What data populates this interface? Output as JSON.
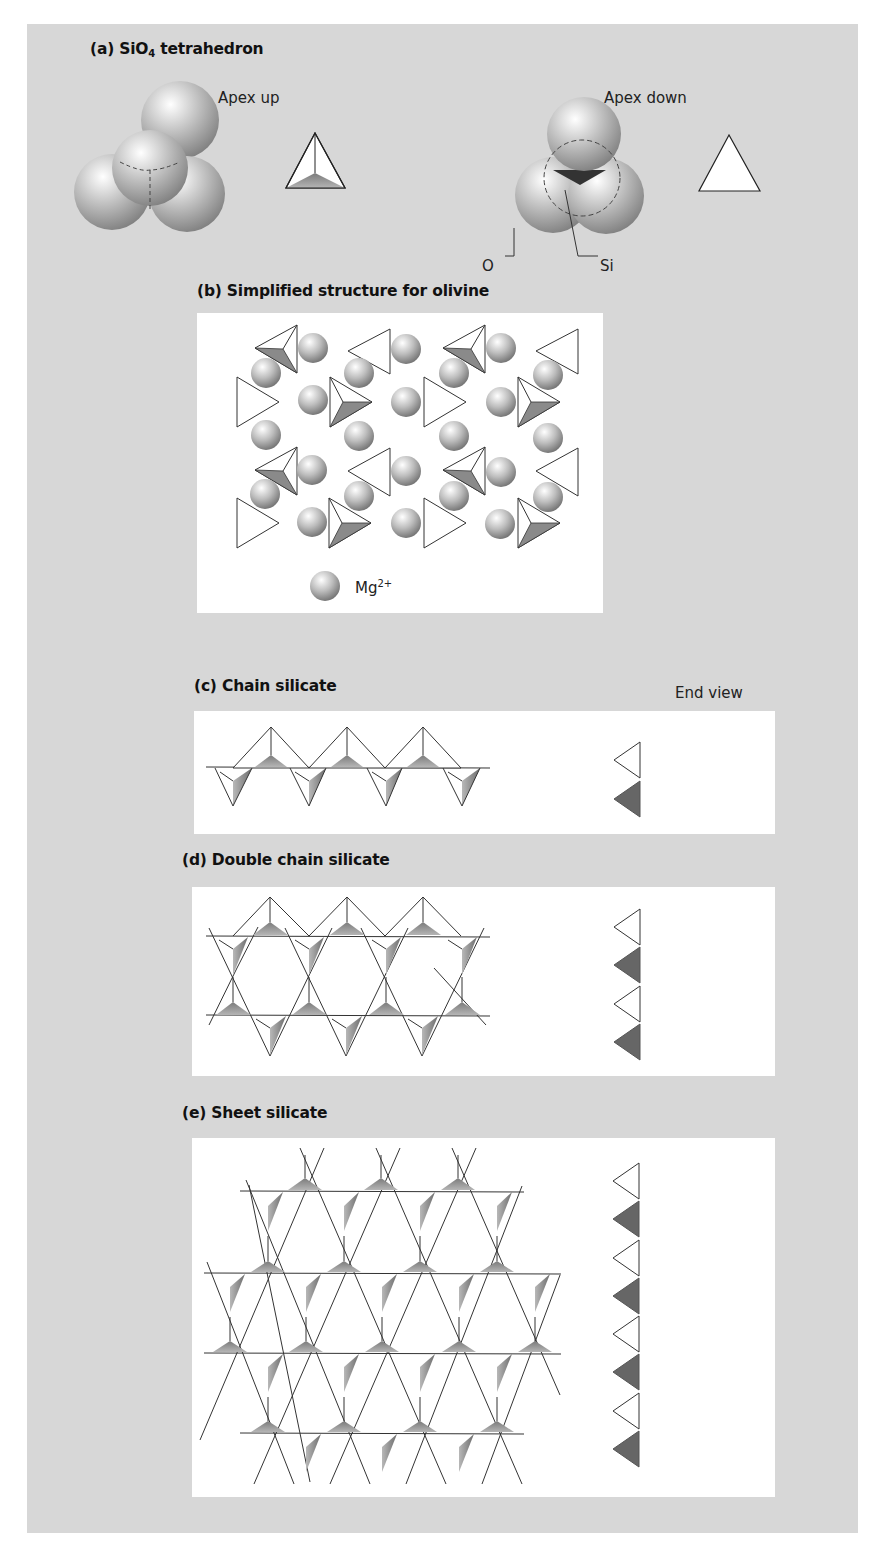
{
  "figure": {
    "background_color": "#d7d7d7",
    "box_color": "#ffffff",
    "dark_face_color": "#6f6f6f",
    "mid_face_color": "#9a9a9a",
    "line_color": "#333333"
  },
  "panel_a": {
    "title_prefix": "(a) SiO",
    "title_subscript": "4",
    "title_suffix": " tetrahedron",
    "apex_up_label": "Apex up",
    "apex_down_label": "Apex down",
    "oxygen_label": "O",
    "silicon_label": "Si"
  },
  "panel_b": {
    "title": "(b) Simplified structure for olivine",
    "legend_label": "Mg",
    "legend_superscript": "2+"
  },
  "panel_c": {
    "title": "(c) Chain silicate",
    "end_view_label": "End view"
  },
  "panel_d": {
    "title": "(d) Double chain silicate"
  },
  "panel_e": {
    "title": "(e) Sheet silicate"
  }
}
